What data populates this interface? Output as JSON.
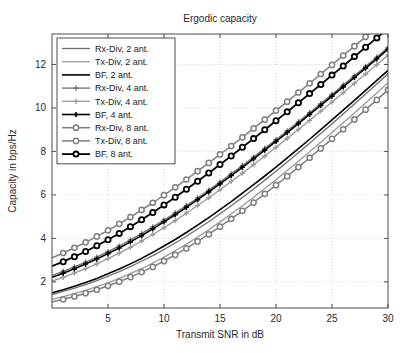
{
  "chart_data": {
    "type": "line",
    "title": "Ergodic capacity",
    "xlabel": "Transmit SNR in dB",
    "ylabel": "Capacity in bps/Hz",
    "xlim": [
      0,
      30
    ],
    "ylim": [
      0.8,
      13.4
    ],
    "xticks": [
      5,
      10,
      15,
      20,
      25,
      30
    ],
    "yticks": [
      2,
      4,
      6,
      8,
      10,
      12
    ],
    "grid": true,
    "legend_position": "upper-left",
    "x": [
      0,
      1,
      2,
      3,
      4,
      5,
      6,
      7,
      8,
      9,
      10,
      11,
      12,
      13,
      14,
      15,
      16,
      17,
      18,
      19,
      20,
      21,
      22,
      23,
      24,
      25,
      26,
      27,
      28,
      29,
      30
    ],
    "series": [
      {
        "name": "Rx-Div, 2 ant.",
        "color": "#6f6f6f",
        "marker": "none",
        "width": 1.3,
        "values": [
          1.42,
          1.56,
          1.71,
          1.88,
          2.06,
          2.26,
          2.47,
          2.7,
          2.95,
          3.21,
          3.49,
          3.79,
          4.1,
          4.43,
          4.77,
          5.13,
          5.5,
          5.88,
          6.27,
          6.68,
          7.09,
          7.51,
          7.94,
          8.38,
          8.82,
          9.27,
          9.72,
          10.18,
          10.64,
          11.1,
          11.57
        ]
      },
      {
        "name": "Tx-Div, 2 ant.",
        "color": "#9a9a9a",
        "marker": "none",
        "width": 1.3,
        "values": [
          1.2,
          1.32,
          1.46,
          1.61,
          1.78,
          1.96,
          2.16,
          2.38,
          2.61,
          2.87,
          3.14,
          3.43,
          3.74,
          4.06,
          4.4,
          4.76,
          5.12,
          5.5,
          5.89,
          6.29,
          6.7,
          7.12,
          7.55,
          7.98,
          8.42,
          8.87,
          9.32,
          9.77,
          10.23,
          10.69,
          11.16
        ]
      },
      {
        "name": "BF, 2 ant.",
        "color": "#000000",
        "marker": "none",
        "width": 1.6,
        "values": [
          1.5,
          1.64,
          1.8,
          1.97,
          2.16,
          2.37,
          2.59,
          2.83,
          3.08,
          3.36,
          3.65,
          3.95,
          4.27,
          4.61,
          4.96,
          5.32,
          5.69,
          6.08,
          6.47,
          6.87,
          7.28,
          7.7,
          8.13,
          8.56,
          9.0,
          9.45,
          9.9,
          10.35,
          10.81,
          11.27,
          11.73
        ]
      },
      {
        "name": "Rx-Div, 4 ant.",
        "color": "#6f6f6f",
        "marker": "plus",
        "width": 1.3,
        "values": [
          2.3,
          2.49,
          2.69,
          2.91,
          3.14,
          3.39,
          3.65,
          3.93,
          4.22,
          4.53,
          4.84,
          5.17,
          5.51,
          5.86,
          6.22,
          6.59,
          6.97,
          7.35,
          7.74,
          8.14,
          8.54,
          8.95,
          9.36,
          9.78,
          10.2,
          10.62,
          11.05,
          11.48,
          11.91,
          12.34,
          12.78
        ]
      },
      {
        "name": "Tx-Div, 4 ant.",
        "color": "#9a9a9a",
        "marker": "plus",
        "width": 1.3,
        "values": [
          2.04,
          2.21,
          2.4,
          2.61,
          2.83,
          3.07,
          3.32,
          3.59,
          3.88,
          4.18,
          4.49,
          4.82,
          5.16,
          5.51,
          5.87,
          6.24,
          6.62,
          7.0,
          7.39,
          7.79,
          8.19,
          8.6,
          9.01,
          9.43,
          9.85,
          10.27,
          10.7,
          11.13,
          11.56,
          11.99,
          12.43
        ]
      },
      {
        "name": "BF, 4 ant.",
        "color": "#000000",
        "marker": "plus",
        "width": 1.6,
        "values": [
          2.21,
          2.4,
          2.6,
          2.82,
          3.05,
          3.3,
          3.56,
          3.84,
          4.13,
          4.44,
          4.76,
          5.09,
          5.43,
          5.78,
          6.14,
          6.51,
          6.89,
          7.27,
          7.66,
          8.06,
          8.46,
          8.87,
          9.28,
          9.7,
          10.12,
          10.54,
          10.97,
          11.4,
          11.83,
          12.26,
          12.7
        ]
      },
      {
        "name": "Rx-Div, 8 ant.",
        "color": "#808080",
        "marker": "circle",
        "width": 1.5,
        "values": [
          3.11,
          3.33,
          3.57,
          3.82,
          4.09,
          4.37,
          4.67,
          4.98,
          5.31,
          5.64,
          5.99,
          6.35,
          6.71,
          7.09,
          7.47,
          7.86,
          8.25,
          8.65,
          9.06,
          9.46,
          9.88,
          10.29,
          10.71,
          11.13,
          11.56,
          11.98,
          12.41,
          12.84,
          13.27,
          13.7,
          14.14
        ]
      },
      {
        "name": "Tx-Div, 8 ant.",
        "color": "#808080",
        "marker": "circle",
        "width": 1.5,
        "values": [
          1.08,
          1.2,
          1.33,
          1.48,
          1.64,
          1.82,
          2.01,
          2.22,
          2.45,
          2.69,
          2.96,
          3.24,
          3.54,
          3.86,
          4.19,
          4.54,
          4.9,
          5.27,
          5.65,
          6.05,
          6.45,
          6.86,
          7.28,
          7.71,
          8.14,
          8.58,
          9.02,
          9.47,
          9.92,
          10.37,
          10.83
        ]
      },
      {
        "name": "BF, 8 ant.",
        "color": "#000000",
        "marker": "circle",
        "width": 1.8,
        "values": [
          2.72,
          2.93,
          3.16,
          3.4,
          3.66,
          3.94,
          4.23,
          4.54,
          4.86,
          5.19,
          5.54,
          5.89,
          6.26,
          6.63,
          7.01,
          7.4,
          7.79,
          8.19,
          8.59,
          9.0,
          9.41,
          9.82,
          10.24,
          10.66,
          11.08,
          11.51,
          11.93,
          12.36,
          12.79,
          13.22,
          13.66
        ]
      }
    ]
  },
  "legend": {
    "entries": [
      "Rx-Div, 2 ant.",
      "Tx-Div, 2 ant.",
      "BF, 2 ant.",
      "Rx-Div, 4 ant.",
      "Tx-Div, 4 ant.",
      "BF, 4 ant.",
      "Rx-Div, 8 ant.",
      "Tx-Div, 8 ant.",
      "BF, 8 ant."
    ]
  },
  "colors": {
    "rx_div": "#6f6f6f",
    "tx_div": "#9a9a9a",
    "bf": "#000000",
    "gray_8ant": "#808080",
    "axis": "#4d4d4d",
    "grid": "#c8c8c8",
    "background": "#ffffff"
  }
}
